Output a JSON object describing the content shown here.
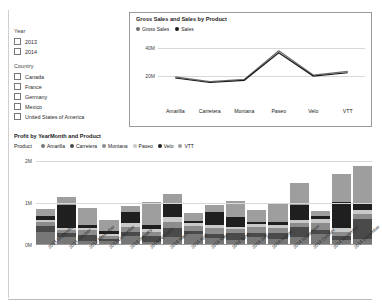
{
  "filters": {
    "groups": [
      {
        "title": "Year",
        "options": [
          {
            "label": "2013",
            "checked": false
          },
          {
            "label": "2014",
            "checked": false
          }
        ]
      },
      {
        "title": "Country",
        "options": [
          {
            "label": "Canada",
            "checked": false
          },
          {
            "label": "France",
            "checked": false
          },
          {
            "label": "Germany",
            "checked": false
          },
          {
            "label": "Mexico",
            "checked": false
          },
          {
            "label": "United States of America",
            "checked": false
          }
        ]
      }
    ]
  },
  "line_panel": {
    "title": "Gross Sales and  Sales by Product"
  },
  "bar_panel": {
    "title": "Profit by YearMonth and Product",
    "legend_caption": "Product"
  },
  "chart_data": [
    {
      "type": "line",
      "title": "Gross Sales and  Sales by Product",
      "xlabel": "",
      "ylabel": "",
      "ylim": [
        0,
        48
      ],
      "yticks": [
        20,
        40
      ],
      "ytick_labels": [
        "20M",
        "40M"
      ],
      "grid": true,
      "legend_position": "top-left",
      "categories": [
        "Amarilla",
        "Carretera",
        "Montana",
        "Paseo",
        "Velo",
        "VTT"
      ],
      "series": [
        {
          "name": "Gross Sales",
          "color": "#6e6e6e",
          "values": [
            19.0,
            15.6,
            17.2,
            38.0,
            20.3,
            23.0
          ]
        },
        {
          "name": "Sales",
          "color": "#1a1a1a",
          "values": [
            18.2,
            14.9,
            16.5,
            36.6,
            19.6,
            22.0
          ]
        }
      ]
    },
    {
      "type": "bar",
      "stacked": true,
      "title": "Profit by YearMonth and Product",
      "xlabel": "",
      "ylabel": "",
      "ylim": [
        0,
        2.2
      ],
      "yticks": [
        0,
        1,
        2
      ],
      "ytick_labels": [
        "0M",
        "1M",
        "2M"
      ],
      "grid": true,
      "legend_position": "top",
      "legend_caption": "Product",
      "categories": [
        "2013 September",
        "2013 October",
        "2013 November",
        "2013 December",
        "2014 January",
        "2014 February",
        "2014 March",
        "2014 April",
        "2014 May",
        "2014 June",
        "2014 July",
        "2014 August",
        "2014 September",
        "2014 October",
        "2014 November",
        "2014 December"
      ],
      "series": [
        {
          "name": "Amarilla",
          "color": "#777777",
          "values": [
            0.3,
            0.18,
            0.09,
            0.1,
            0.22,
            0.07,
            0.18,
            0.26,
            0.16,
            0.12,
            0.18,
            0.14,
            0.2,
            0.26,
            0.12,
            0.15
          ]
        },
        {
          "name": "Carretera",
          "color": "#4a4a4a",
          "values": [
            0.16,
            0.1,
            0.14,
            0.05,
            0.1,
            0.14,
            0.22,
            0.08,
            0.1,
            0.16,
            0.1,
            0.14,
            0.22,
            0.1,
            0.09,
            0.48
          ]
        },
        {
          "name": "Montana",
          "color": "#8c8c8c",
          "values": [
            0.08,
            0.07,
            0.12,
            0.06,
            0.12,
            0.1,
            0.14,
            0.12,
            0.14,
            0.1,
            0.14,
            0.12,
            0.1,
            0.16,
            0.1,
            0.12
          ]
        },
        {
          "name": "Paseo",
          "color": "#c9c9c9",
          "values": [
            0.06,
            0.05,
            0.06,
            0.05,
            0.08,
            0.08,
            0.12,
            0.06,
            0.08,
            0.06,
            0.08,
            0.08,
            0.08,
            0.1,
            0.1,
            0.08
          ]
        },
        {
          "name": "Velo",
          "color": "#1f1f1f",
          "values": [
            0.1,
            0.55,
            0.06,
            0.07,
            0.26,
            0.08,
            0.34,
            0.05,
            0.3,
            0.22,
            0.05,
            0.08,
            0.36,
            0.07,
            0.62,
            0.18
          ]
        },
        {
          "name": "VTT",
          "color": "#9e9e9e",
          "values": [
            0.16,
            0.2,
            0.42,
            0.28,
            0.16,
            0.55,
            0.22,
            0.2,
            0.18,
            0.4,
            0.28,
            0.42,
            0.52,
            0.12,
            0.68,
            0.88
          ]
        }
      ]
    }
  ]
}
